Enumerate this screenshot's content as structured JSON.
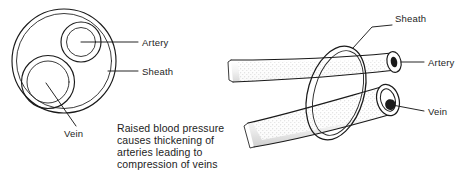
{
  "figure": {
    "title_fragment": "",
    "background_color": "#ffffff",
    "ink_color": "#1a1a1a"
  },
  "left_panel": {
    "name": "cross-section-view",
    "labels": {
      "artery": "Artery",
      "sheath": "Sheath",
      "vein": "Vein"
    }
  },
  "right_panel": {
    "name": "perspective-view",
    "labels": {
      "sheath": "Sheath",
      "artery": "Artery",
      "vein": "Vein"
    }
  },
  "caption": {
    "lines": [
      "Raised blood pressure",
      "causes thickening of",
      "arteries leading to",
      "compression of veins"
    ],
    "line_0": "Raised blood pressure",
    "line_1": "causes thickening of",
    "line_2": "arteries leading to",
    "line_3": "compression of veins"
  }
}
